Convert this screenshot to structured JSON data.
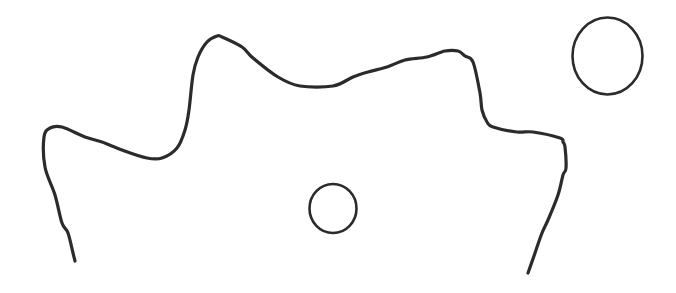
{
  "drawing": {
    "background": "#ffffff",
    "stroke_color": "#2b2b2b",
    "outline": {
      "label": "wavy-outline",
      "stroke_width": 3.2,
      "points": [
        [
          75,
          261
        ],
        [
          73,
          253
        ],
        [
          68,
          233
        ],
        [
          62,
          223
        ],
        [
          55,
          195
        ],
        [
          45,
          167
        ],
        [
          44,
          137
        ],
        [
          50,
          128
        ],
        [
          62,
          127
        ],
        [
          85,
          137
        ],
        [
          102,
          142
        ],
        [
          122,
          150
        ],
        [
          147,
          158
        ],
        [
          162,
          158
        ],
        [
          177,
          148
        ],
        [
          185,
          130
        ],
        [
          189,
          110
        ],
        [
          193,
          75
        ],
        [
          198,
          57
        ],
        [
          207,
          42
        ],
        [
          217,
          36
        ],
        [
          222,
          37
        ],
        [
          242,
          47
        ],
        [
          253,
          58
        ],
        [
          278,
          77
        ],
        [
          300,
          86
        ],
        [
          333,
          86
        ],
        [
          353,
          77
        ],
        [
          368,
          72
        ],
        [
          387,
          67
        ],
        [
          405,
          60
        ],
        [
          427,
          57
        ],
        [
          445,
          51
        ],
        [
          458,
          51
        ],
        [
          465,
          56
        ],
        [
          473,
          62
        ],
        [
          480,
          93
        ],
        [
          482,
          110
        ],
        [
          487,
          122
        ],
        [
          493,
          127
        ],
        [
          517,
          132
        ],
        [
          533,
          132
        ],
        [
          560,
          138
        ],
        [
          563,
          142
        ],
        [
          565,
          147
        ],
        [
          566,
          168
        ],
        [
          563,
          175
        ],
        [
          558,
          195
        ],
        [
          548,
          220
        ],
        [
          542,
          233
        ],
        [
          535,
          253
        ],
        [
          528,
          273
        ]
      ]
    },
    "circles": [
      {
        "label": "small-circle",
        "cx": 333,
        "cy": 208.5,
        "rx": 23.5,
        "ry": 24.5,
        "stroke_width": 2.6
      },
      {
        "label": "large-circle",
        "cx": 607.5,
        "cy": 56,
        "rx": 35,
        "ry": 38.5,
        "stroke_width": 2.6
      }
    ]
  }
}
